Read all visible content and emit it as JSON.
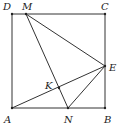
{
  "figure": {
    "type": "geometry-square",
    "stroke_color": "#333333",
    "background": "#ffffff",
    "points": {
      "A": {
        "label": "A",
        "x": 12,
        "y": 108
      },
      "B": {
        "label": "B",
        "x": 105,
        "y": 108
      },
      "C": {
        "label": "C",
        "x": 105,
        "y": 14
      },
      "D": {
        "label": "D",
        "x": 12,
        "y": 14
      },
      "M": {
        "label": "M",
        "x": 26,
        "y": 14
      },
      "N": {
        "label": "N",
        "x": 68,
        "y": 108
      },
      "E": {
        "label": "E",
        "x": 105,
        "y": 66
      },
      "K": {
        "label": "K",
        "x": 59,
        "y": 88
      }
    },
    "segments": [
      "AB",
      "BC",
      "CD",
      "DA",
      "ME",
      "MN",
      "AE",
      "NE"
    ]
  }
}
